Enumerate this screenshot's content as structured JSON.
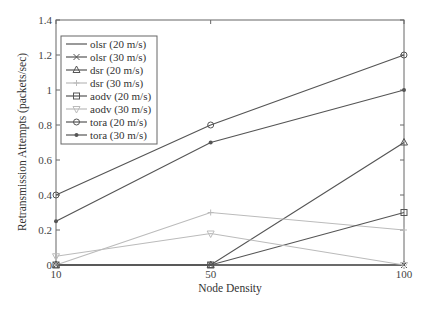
{
  "chart_data": {
    "type": "line",
    "title": "",
    "xlabel": "Node Density",
    "ylabel": "Retransmission Attempts (packets/sec)",
    "x": [
      10,
      50,
      100
    ],
    "xlim": [
      10,
      100
    ],
    "ylim": [
      0,
      1.4
    ],
    "xticks": [
      "10",
      "50",
      "100"
    ],
    "yticks": [
      "0",
      "0.2",
      "0.4",
      "0.6",
      "0.8",
      "1",
      "1.2",
      "1.4"
    ],
    "grid": false,
    "legend_position": "upper left",
    "series": [
      {
        "name": "olsr (20 m/s)",
        "values": [
          0,
          0,
          0
        ],
        "color": "#555555",
        "marker": "none"
      },
      {
        "name": "olsr (30 m/s)",
        "values": [
          0,
          0,
          0
        ],
        "color": "#555555",
        "marker": "x"
      },
      {
        "name": "dsr (20 m/s)",
        "values": [
          0,
          0,
          0.7
        ],
        "color": "#555555",
        "marker": "triangle-up"
      },
      {
        "name": "dsr (30 m/s)",
        "values": [
          0,
          0.3,
          0.2
        ],
        "color": "#bbbbbb",
        "marker": "plus"
      },
      {
        "name": "aodv (20 m/s)",
        "values": [
          0,
          0,
          0.3
        ],
        "color": "#555555",
        "marker": "square"
      },
      {
        "name": "aodv (30 m/s)",
        "values": [
          0.05,
          0.18,
          0
        ],
        "color": "#bbbbbb",
        "marker": "triangle-down"
      },
      {
        "name": "tora (20 m/s)",
        "values": [
          0.4,
          0.8,
          1.2
        ],
        "color": "#555555",
        "marker": "circle"
      },
      {
        "name": "tora (30 m/s)",
        "values": [
          0.25,
          0.7,
          1.0
        ],
        "color": "#555555",
        "marker": "dot"
      }
    ]
  }
}
